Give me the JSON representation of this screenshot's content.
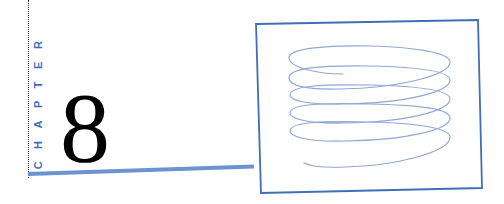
{
  "chapter": {
    "label": "CHAPTER",
    "number": "8",
    "faint_text": ""
  },
  "figure": {
    "type": "spiral-coil-illustration",
    "frame_color": "#3f6fb6",
    "stroke_color": "#8fa8d4",
    "loops": 5
  },
  "colors": {
    "accent": "#3f6fb6",
    "rule": "#6a93cf",
    "text": "#000000"
  }
}
